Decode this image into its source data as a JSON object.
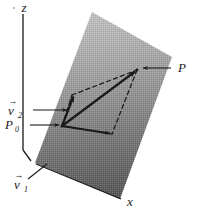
{
  "figure": {
    "background_color": "#ffffff",
    "ink_color": "#1a1a1a",
    "plane": {
      "name": "shaded-plane",
      "fill_top_color": "#b9b9b9",
      "fill_bottom_color": "#575757",
      "corners": [
        [
          92,
          12
        ],
        [
          172,
          57
        ],
        [
          120,
          199
        ],
        [
          35,
          163
        ]
      ]
    },
    "axes": [
      {
        "name": "z-axis",
        "label": "z",
        "label_x": 27,
        "label_y": 11,
        "line": [
          [
            23,
            14
          ],
          [
            23,
            150
          ]
        ],
        "foot": [
          [
            23,
            150
          ],
          [
            30,
            160
          ]
        ]
      },
      {
        "name": "x-axis",
        "label": "x",
        "label_x": 127,
        "label_y": 205,
        "line": [
          [
            35,
            163
          ],
          [
            122,
            200
          ]
        ]
      }
    ],
    "points": [
      {
        "name": "P0",
        "label": "P",
        "subscript": "0",
        "x": 62,
        "y": 126
      },
      {
        "name": "P",
        "label": "P",
        "subscript": "",
        "x": 137,
        "y": 70
      }
    ],
    "vectors": [
      {
        "name": "v1",
        "label": "v",
        "subscript": "1",
        "label_x": 14,
        "label_y": 188
      },
      {
        "name": "v2",
        "label": "v",
        "subscript": "2",
        "label_x": 8,
        "label_y": 114
      },
      {
        "name": "position-vector-P0-to-P",
        "label": "",
        "subscript": ""
      }
    ],
    "leaders": [
      {
        "name": "leader-v2",
        "from": [
          32,
          110
        ],
        "to": [
          68,
          110
        ]
      },
      {
        "name": "leader-P0",
        "from": [
          28,
          125
        ],
        "to": [
          60,
          125
        ]
      },
      {
        "name": "leader-P",
        "from": [
          172,
          68
        ],
        "to": [
          142,
          68
        ]
      },
      {
        "name": "leader-v1",
        "from": [
          28,
          178
        ],
        "to": [
          45,
          166
        ]
      }
    ],
    "parallelogram": {
      "name": "dashed-parallelogram",
      "corners": [
        [
          62,
          126
        ],
        [
          72,
          95
        ],
        [
          137,
          70
        ],
        [
          112,
          134
        ]
      ],
      "style": "dashed"
    }
  }
}
